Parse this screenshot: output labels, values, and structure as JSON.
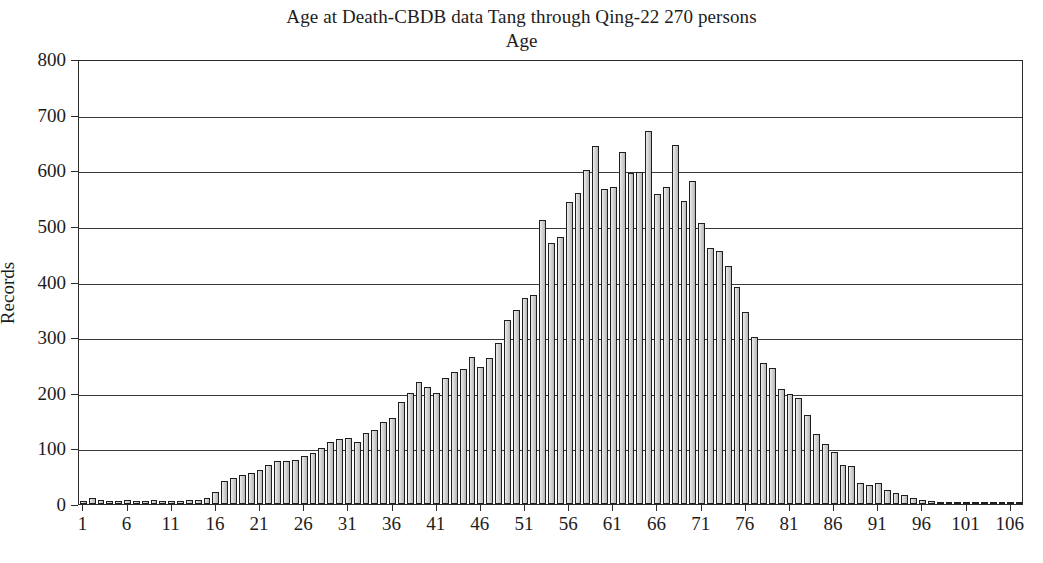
{
  "chart_data": {
    "type": "bar",
    "title": "Age at Death-CBDB data Tang through Qing-22 270 persons",
    "xlabel": "Age",
    "ylabel": "Records",
    "ylim": [
      0,
      800
    ],
    "xlim": [
      1,
      107
    ],
    "ytick_labels": [
      "0",
      "100",
      "200",
      "300",
      "400",
      "500",
      "600",
      "700",
      "800"
    ],
    "ytick_values": [
      0,
      100,
      200,
      300,
      400,
      500,
      600,
      700,
      800
    ],
    "xtick_labels": [
      "1",
      "6",
      "11",
      "16",
      "21",
      "26",
      "31",
      "36",
      "41",
      "46",
      "51",
      "56",
      "61",
      "66",
      "71",
      "76",
      "81",
      "86",
      "91",
      "96",
      "101",
      "106"
    ],
    "xtick_values": [
      1,
      6,
      11,
      16,
      21,
      26,
      31,
      36,
      41,
      46,
      51,
      56,
      61,
      66,
      71,
      76,
      81,
      86,
      91,
      96,
      101,
      106
    ],
    "grid": "horizontal",
    "legend": null,
    "bar_fill_color": "#c9c9c9",
    "bar_edge_color": "#1e1e1e",
    "categories": [
      1,
      2,
      3,
      4,
      5,
      6,
      7,
      8,
      9,
      10,
      11,
      12,
      13,
      14,
      15,
      16,
      17,
      18,
      19,
      20,
      21,
      22,
      23,
      24,
      25,
      26,
      27,
      28,
      29,
      30,
      31,
      32,
      33,
      34,
      35,
      36,
      37,
      38,
      39,
      40,
      41,
      42,
      43,
      44,
      45,
      46,
      47,
      48,
      49,
      50,
      51,
      52,
      53,
      54,
      55,
      56,
      57,
      58,
      59,
      60,
      61,
      62,
      63,
      64,
      65,
      66,
      67,
      68,
      69,
      70,
      71,
      72,
      73,
      74,
      75,
      76,
      77,
      78,
      79,
      80,
      81,
      82,
      83,
      84,
      85,
      86,
      87,
      88,
      89,
      90,
      91,
      92,
      93,
      94,
      95,
      96,
      97,
      98,
      99,
      100,
      101,
      102,
      103,
      104,
      105,
      106,
      107
    ],
    "values": [
      6,
      10,
      7,
      6,
      6,
      7,
      5,
      5,
      8,
      6,
      6,
      6,
      7,
      8,
      10,
      22,
      42,
      47,
      52,
      55,
      62,
      70,
      78,
      77,
      80,
      86,
      92,
      100,
      112,
      117,
      118,
      112,
      127,
      133,
      148,
      155,
      183,
      200,
      220,
      211,
      200,
      227,
      238,
      243,
      265,
      246,
      262,
      290,
      330,
      348,
      370,
      375,
      510,
      470,
      480,
      543,
      560,
      600,
      643,
      567,
      570,
      633,
      595,
      597,
      670,
      558,
      570,
      645,
      545,
      580,
      505,
      460,
      455,
      428,
      390,
      345,
      300,
      253,
      245,
      207,
      197,
      190,
      160,
      125,
      108,
      93,
      70,
      68,
      37,
      34,
      37,
      25,
      20,
      16,
      10,
      7,
      5,
      4,
      4,
      4,
      3,
      3,
      3,
      3,
      3,
      3,
      2
    ]
  }
}
